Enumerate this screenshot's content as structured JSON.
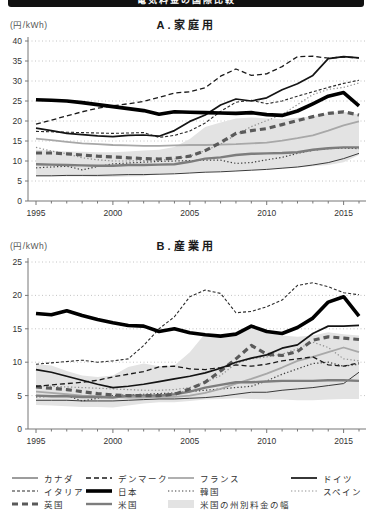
{
  "header": {
    "title": "電気料金の国際比較"
  },
  "styles": {
    "canada": {
      "color": "#3a3a3a",
      "width": 1,
      "dash": ""
    },
    "denmark": {
      "color": "#1a1a1a",
      "width": 1.3,
      "dash": "5 3"
    },
    "france": {
      "color": "#a8a8a8",
      "width": 1.8,
      "dash": ""
    },
    "germany": {
      "color": "#141414",
      "width": 1.7,
      "dash": ""
    },
    "italy": {
      "color": "#2a2a2a",
      "width": 1.1,
      "dash": "3 2"
    },
    "japan": {
      "color": "#000000",
      "width": 3.6,
      "dash": ""
    },
    "korea": {
      "color": "#3c3c3c",
      "width": 1.2,
      "dash": "1.3 2.2"
    },
    "spain": {
      "color": "#8f8f8f",
      "width": 1.2,
      "dash": "1.3 2.2"
    },
    "uk": {
      "color": "#5a5a5a",
      "width": 3.2,
      "dash": "6 4"
    },
    "us": {
      "color": "#7d7d7d",
      "width": 2.4,
      "dash": ""
    },
    "band_fill": "#e3e3e3",
    "grid_color": "#b5b5b5",
    "axis_color": "#777777",
    "tick_label_color": "#333333"
  },
  "legend": {
    "rows": [
      [
        {
          "key": "canada",
          "label": "カナダ"
        },
        {
          "key": "denmark",
          "label": "デンマーク"
        },
        {
          "key": "france",
          "label": "フランス"
        },
        {
          "key": "germany",
          "label": "ドイツ"
        }
      ],
      [
        {
          "key": "italy",
          "label": "イタリア"
        },
        {
          "key": "japan",
          "label": "日本"
        },
        {
          "key": "korea",
          "label": "韓国"
        },
        {
          "key": "spain",
          "label": "スペイン"
        }
      ],
      [
        {
          "key": "uk",
          "label": "英国"
        },
        {
          "key": "us",
          "label": "米国"
        },
        {
          "key": "band",
          "label": "米国の州別料金の幅"
        }
      ]
    ]
  },
  "chart_data": [
    {
      "type": "line",
      "title": "A.家庭用",
      "unit": "(円/kWh)",
      "ylim": [
        0,
        40
      ],
      "ytick_step": 5,
      "yticks": [
        0,
        5,
        10,
        15,
        20,
        25,
        30,
        35,
        40
      ],
      "x_range": [
        1995,
        2016
      ],
      "xticks": [
        1995,
        2000,
        2005,
        2010,
        2015
      ],
      "grid": "dotted",
      "series": [
        {
          "key": "japan",
          "name": "日本",
          "values": [
            25.3,
            25.2,
            25.0,
            24.6,
            24.1,
            23.6,
            23.1,
            22.6,
            21.7,
            22.3,
            22.2,
            22.1,
            22.0,
            21.9,
            22.1,
            21.6,
            21.4,
            22.5,
            24.3,
            26.2,
            27.1,
            23.8
          ]
        },
        {
          "key": "denmark",
          "name": "デンマーク",
          "values": [
            19.2,
            20.2,
            21.3,
            22.3,
            23.2,
            23.8,
            24.3,
            24.9,
            25.9,
            27.0,
            27.3,
            28.3,
            31.2,
            33.0,
            31.4,
            31.8,
            33.6,
            36.1,
            36.2,
            35.7,
            36.0,
            35.8
          ]
        },
        {
          "key": "germany",
          "name": "ドイツ",
          "values": [
            18.2,
            17.6,
            16.9,
            16.6,
            16.3,
            16.1,
            16.4,
            16.5,
            16.2,
            17.6,
            19.9,
            21.5,
            24.0,
            25.5,
            25.0,
            25.8,
            27.8,
            29.3,
            31.4,
            35.6,
            36.1,
            35.8
          ]
        },
        {
          "key": "italy",
          "name": "イタリア",
          "values": [
            17.4,
            17.3,
            17.2,
            17.1,
            17.0,
            16.9,
            17.0,
            17.1,
            15.9,
            16.4,
            17.5,
            19.5,
            22.4,
            24.7,
            25.2,
            24.3,
            25.0,
            26.2,
            27.3,
            28.4,
            29.4,
            30.2
          ]
        },
        {
          "key": "spain",
          "name": "スペイン",
          "values": [
            13.4,
            12.5,
            11.8,
            10.8,
            10.3,
            10.0,
            10.0,
            10.1,
            10.2,
            10.5,
            11.2,
            12.6,
            14.2,
            16.6,
            18.6,
            20.1,
            21.6,
            24.1,
            26.6,
            27.9,
            28.4,
            29.5
          ]
        },
        {
          "key": "france",
          "name": "フランス",
          "values": [
            15.6,
            15.2,
            14.8,
            14.4,
            14.2,
            14.0,
            13.9,
            13.8,
            13.8,
            13.9,
            14.0,
            14.0,
            14.1,
            14.2,
            14.4,
            14.6,
            15.1,
            15.7,
            16.4,
            17.6,
            18.9,
            19.9
          ]
        },
        {
          "key": "uk",
          "name": "英国",
          "values": [
            12.0,
            12.0,
            11.8,
            11.5,
            11.2,
            11.0,
            10.8,
            10.6,
            10.5,
            10.7,
            11.2,
            12.6,
            14.6,
            16.9,
            17.6,
            18.1,
            19.1,
            20.1,
            21.1,
            21.9,
            22.3,
            21.5
          ]
        },
        {
          "key": "us",
          "name": "米国",
          "values": [
            9.2,
            9.1,
            9.0,
            8.9,
            8.8,
            8.8,
            9.0,
            9.0,
            9.1,
            9.2,
            9.8,
            10.6,
            10.9,
            11.5,
            11.8,
            11.9,
            12.0,
            12.2,
            12.8,
            13.2,
            13.4,
            13.4
          ]
        },
        {
          "key": "korea",
          "name": "韓国",
          "values": [
            8.3,
            8.5,
            8.7,
            7.8,
            8.6,
            9.3,
            9.5,
            9.7,
            9.9,
            10.0,
            10.1,
            10.2,
            10.2,
            9.4,
            9.6,
            10.3,
            10.9,
            11.9,
            12.7,
            13.1,
            13.2,
            13.1
          ]
        },
        {
          "key": "canada",
          "name": "カナダ",
          "values": [
            6.3,
            6.3,
            6.4,
            6.4,
            6.4,
            6.5,
            6.6,
            6.6,
            6.7,
            6.8,
            7.0,
            7.2,
            7.3,
            7.5,
            7.7,
            7.9,
            8.2,
            8.5,
            9.0,
            9.6,
            10.6,
            11.9
          ]
        }
      ],
      "us_band": {
        "name": "米国の州別料金の幅",
        "low": [
          6.2,
          6.2,
          6.1,
          6.1,
          6.0,
          6.0,
          6.1,
          6.2,
          6.9,
          7.0,
          7.1,
          7.3,
          7.5,
          7.6,
          7.8,
          8.0,
          8.2,
          8.4,
          8.7,
          9.0,
          9.7,
          11.5
        ],
        "high": [
          12.8,
          12.6,
          12.4,
          12.3,
          12.2,
          12.2,
          12.4,
          12.6,
          12.8,
          13.5,
          15.5,
          18.5,
          19.6,
          20.6,
          20.9,
          20.6,
          20.5,
          20.8,
          21.2,
          22.0,
          22.3,
          21.6
        ]
      }
    },
    {
      "type": "line",
      "title": "B.産業用",
      "unit": "(円/kWh)",
      "ylim": [
        0,
        25
      ],
      "ytick_step": 5,
      "yticks": [
        0,
        5,
        10,
        15,
        20,
        25
      ],
      "x_range": [
        1995,
        2016
      ],
      "xticks": [
        1995,
        2000,
        2005,
        2010,
        2015
      ],
      "grid": "dotted",
      "series": [
        {
          "key": "japan",
          "name": "日本",
          "values": [
            17.3,
            17.1,
            17.7,
            17.0,
            16.4,
            15.9,
            15.5,
            15.4,
            14.6,
            15.0,
            14.4,
            14.1,
            13.9,
            14.2,
            15.4,
            14.6,
            14.3,
            15.2,
            16.6,
            19.0,
            19.8,
            16.9
          ]
        },
        {
          "key": "italy",
          "name": "イタリア",
          "values": [
            9.7,
            9.9,
            10.1,
            10.3,
            10.0,
            10.2,
            10.5,
            12.5,
            15.0,
            16.8,
            19.8,
            20.8,
            20.3,
            17.4,
            17.6,
            18.3,
            19.3,
            21.5,
            21.9,
            21.3,
            20.4,
            20.1
          ]
        },
        {
          "key": "germany",
          "name": "ドイツ",
          "values": [
            8.9,
            8.5,
            7.9,
            7.3,
            6.7,
            6.2,
            6.4,
            6.7,
            7.1,
            7.5,
            7.9,
            8.4,
            9.1,
            10.0,
            10.6,
            11.1,
            12.1,
            12.6,
            14.3,
            15.4,
            15.4,
            15.5
          ]
        },
        {
          "key": "denmark",
          "name": "デンマーク",
          "values": [
            6.4,
            6.6,
            6.8,
            7.0,
            7.3,
            7.8,
            8.2,
            8.6,
            9.3,
            9.4,
            9.0,
            8.9,
            9.2,
            9.6,
            9.4,
            9.7,
            10.2,
            10.5,
            10.8,
            9.6,
            9.4,
            9.9
          ]
        },
        {
          "key": "uk",
          "name": "英国",
          "values": [
            6.3,
            6.1,
            5.9,
            5.6,
            5.3,
            5.1,
            5.0,
            5.0,
            5.0,
            5.2,
            6.0,
            7.0,
            8.7,
            10.5,
            12.5,
            11.2,
            11.0,
            11.6,
            13.3,
            13.8,
            13.6,
            13.4
          ]
        },
        {
          "key": "france",
          "name": "フランス",
          "values": [
            5.6,
            5.4,
            5.2,
            5.0,
            4.9,
            4.8,
            4.7,
            4.7,
            4.8,
            4.8,
            5.0,
            5.4,
            6.0,
            6.8,
            7.5,
            8.3,
            9.2,
            10.2,
            10.8,
            11.5,
            12.2,
            11.5
          ]
        },
        {
          "key": "us",
          "name": "米国",
          "values": [
            5.0,
            4.9,
            4.9,
            4.8,
            4.8,
            4.7,
            5.0,
            5.0,
            5.0,
            5.2,
            5.6,
            6.2,
            6.6,
            7.0,
            7.0,
            7.1,
            7.2,
            7.2,
            7.2,
            7.3,
            7.3,
            7.2
          ]
        },
        {
          "key": "spain",
          "name": "スペイン",
          "values": [
            6.5,
            6.4,
            6.3,
            6.2,
            6.1,
            6.0,
            5.9,
            5.8,
            5.8,
            5.9,
            6.2,
            7.0,
            8.0,
            9.8,
            10.5,
            10.8,
            11.2,
            12.0,
            13.0,
            12.2,
            10.5,
            10.2
          ]
        },
        {
          "key": "korea",
          "name": "韓国",
          "values": [
            4.8,
            4.9,
            5.0,
            4.2,
            4.6,
            5.0,
            5.1,
            5.2,
            5.3,
            5.4,
            5.6,
            5.8,
            6.0,
            6.2,
            6.4,
            7.2,
            8.2,
            9.0,
            9.8,
            10.0,
            9.4,
            9.7
          ]
        },
        {
          "key": "canada",
          "name": "カナダ",
          "values": [
            4.3,
            4.3,
            4.3,
            4.2,
            4.2,
            4.2,
            4.3,
            4.4,
            4.5,
            4.5,
            4.6,
            4.7,
            4.9,
            5.2,
            5.5,
            5.5,
            5.8,
            6.0,
            6.2,
            6.5,
            6.8,
            8.5
          ]
        }
      ],
      "us_band": {
        "name": "米国の州別料金の幅",
        "low": [
          3.6,
          3.5,
          3.4,
          3.3,
          3.3,
          3.2,
          3.5,
          3.8,
          4.0,
          4.0,
          4.2,
          4.4,
          4.5,
          4.6,
          4.5,
          4.4,
          4.4,
          4.3,
          4.3,
          4.4,
          4.5,
          4.5
        ],
        "high": [
          9.7,
          9.5,
          8.7,
          8.0,
          7.8,
          8.0,
          9.3,
          9.8,
          9.4,
          9.5,
          11.5,
          14.3,
          13.8,
          14.2,
          15.0,
          14.5,
          14.0,
          13.8,
          14.0,
          14.5,
          14.2,
          14.0
        ]
      }
    }
  ]
}
